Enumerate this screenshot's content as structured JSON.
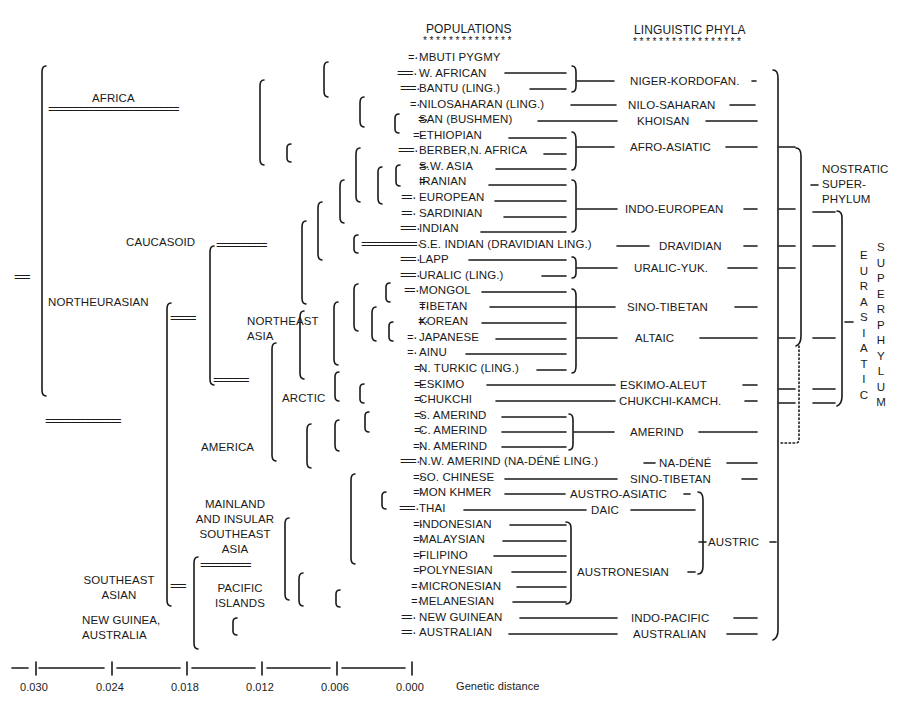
{
  "headers": {
    "populations": "POPULATIONS",
    "populations_stars": "**************",
    "phyla": "LINGUISTIC PHYLA",
    "phyla_stars": "*****************"
  },
  "root_marker": "===",
  "regions": {
    "africa": "AFRICA",
    "northeurasian": "NORTHEURASIAN",
    "caucasoid": "CAUCASOID",
    "northeast_asia_1": "NORTHEAST",
    "northeast_asia_2": "ASIA",
    "arctic": "ARCTIC",
    "america": "AMERICA",
    "mainland_1": "MAINLAND",
    "mainland_2": "AND INSULAR",
    "mainland_3": "SOUTHEAST",
    "mainland_4": "ASIA",
    "pacific_1": "PACIFIC",
    "pacific_2": "ISLANDS",
    "southeast_asian_1": "SOUTHEAST",
    "southeast_asian_2": "ASIAN",
    "newguinea_1": "NEW GUINEA,",
    "newguinea_2": "AUSTRALIA"
  },
  "populations": [
    "MBUTI PYGMY",
    "W. AFRICAN",
    "BANTU (LING.)",
    "NILOSAHARAN (LING.)",
    "SAN (BUSHMEN)",
    "ETHIOPIAN",
    "BERBER,N. AFRICA",
    "S.W. ASIA",
    "IRANIAN",
    "EUROPEAN",
    "SARDINIAN",
    "INDIAN",
    "S.E. INDIAN (DRAVIDIAN LING.)",
    "LAPP",
    "URALIC (LING.)",
    "MONGOL",
    "TIBETAN",
    "KOREAN",
    "JAPANESE",
    "AINU",
    "N. TURKIC (LING.)",
    "ESKIMO",
    "CHUKCHI",
    "S. AMERIND",
    "C. AMERIND",
    "N. AMERIND",
    "N.W. AMERIND (NA-DÉNÉ LING.)",
    "SO. CHINESE",
    "MON KHMER",
    "THAI",
    "INDONESIAN",
    "MALAYSIAN",
    "FILIPINO",
    "POLYNESIAN",
    "MICRONESIAN",
    "MELANESIAN",
    "NEW GUINEAN",
    "AUSTRALIAN"
  ],
  "phyla": {
    "niger_kordofan": "NIGER-KORDOFAN.",
    "nilo_saharan": "NILO-SAHARAN",
    "khoisan": "KHOISAN",
    "afro_asiatic": "AFRO-ASIATIC",
    "indo_european": "INDO-EUROPEAN",
    "dravidian": "DRAVIDIAN",
    "uralic_yuk": "URALIC-YUK.",
    "sino_tibetan_1": "SINO-TIBETAN",
    "altaic": "ALTAIC",
    "eskimo_aleut": "ESKIMO-ALEUT",
    "chukchi_kamch": "CHUKCHI-KAMCH.",
    "amerind": "AMERIND",
    "na_dene": "NA-DÉNÉ",
    "sino_tibetan_2": "SINO-TIBETAN",
    "austro_asiatic": "AUSTRO-ASIATIC",
    "daic": "DAIC",
    "austronesian": "AUSTRONESIAN",
    "austric": "AUSTRIC",
    "indo_pacific": "INDO-PACIFIC",
    "australian": "AUSTRALIAN"
  },
  "superphyla": {
    "nostratic_1": "NOSTRATIC",
    "nostratic_2": "SUPER-",
    "nostratic_3": "PHYLUM",
    "eurasiatic": [
      "E",
      "U",
      "R",
      "A",
      "S",
      "I",
      "A",
      "T",
      "I",
      "C"
    ],
    "superphylum": [
      "S",
      "U",
      "P",
      "E",
      "R",
      "P",
      "H",
      "Y",
      "L",
      "U",
      "M"
    ]
  },
  "axis": {
    "ticks": [
      "0.030",
      "0.024",
      "0.018",
      "0.012",
      "0.006",
      "0.000"
    ],
    "label": "Genetic distance"
  },
  "colors": {
    "ink": "#1a1a1a",
    "background": "#ffffff"
  }
}
